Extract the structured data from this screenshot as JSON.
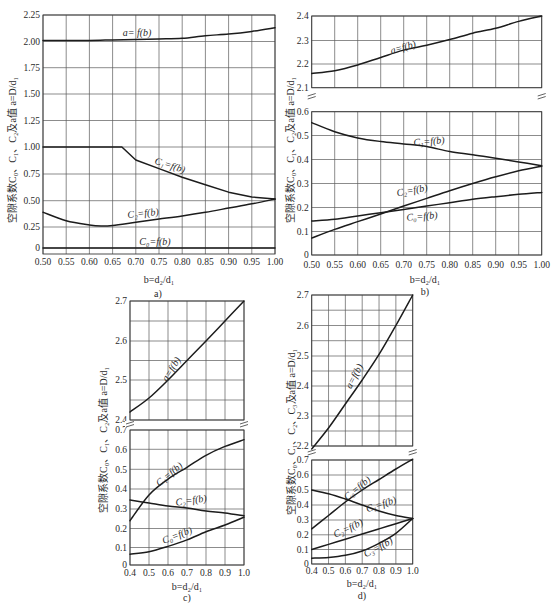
{
  "chart_data": [
    {
      "id": "a",
      "type": "line",
      "caption": "a)",
      "title": "",
      "xlabel": "b=d₂/d₁",
      "ylabel": "空隙系数C₀、C₁、C₂及a值  a=D/d₁",
      "xlim": [
        0.5,
        1.0
      ],
      "x_ticks": [
        0.5,
        0.55,
        0.6,
        0.65,
        0.7,
        0.75,
        0.8,
        0.85,
        0.9,
        0.95,
        1.0
      ],
      "x_tick_labels": [
        "0.50",
        "0.55",
        "0.60",
        "0.65",
        "0.70",
        "0.75",
        "0.80",
        "0.85",
        "0.90",
        "0.95",
        "1.00"
      ],
      "grid": true,
      "y_axes": [
        {
          "range": [
            0,
            2.25
          ],
          "ticks": [
            0,
            0.25,
            0.5,
            0.75,
            1.0,
            1.25,
            1.5,
            1.75,
            2.0,
            2.25
          ],
          "tick_labels": [
            "0",
            "0.25",
            "0.50",
            "0.75",
            "1.00",
            "1.25",
            "1.50",
            "1.75",
            "2.00",
            "2.25"
          ]
        }
      ],
      "series": [
        {
          "name": "a",
          "label": "a= f(b)",
          "axis": 0,
          "x": [
            0.5,
            0.55,
            0.6,
            0.65,
            0.7,
            0.75,
            0.8,
            0.85,
            0.9,
            0.95,
            1.0
          ],
          "y": [
            2.01,
            2.01,
            2.01,
            2.015,
            2.02,
            2.024,
            2.03,
            2.055,
            2.07,
            2.095,
            2.13
          ]
        },
        {
          "name": "C1",
          "label": "C₁=f(b)",
          "axis": 0,
          "x": [
            0.5,
            0.55,
            0.6,
            0.65,
            0.67,
            0.7,
            0.75,
            0.8,
            0.85,
            0.9,
            0.95,
            1.0
          ],
          "y": [
            1.0,
            1.0,
            1.0,
            1.0,
            1.0,
            0.88,
            0.8,
            0.72,
            0.65,
            0.58,
            0.535,
            0.515
          ]
        },
        {
          "name": "C2",
          "label": "C₂=f(b)",
          "axis": 0,
          "x": [
            0.5,
            0.55,
            0.6,
            0.625,
            0.65,
            0.7,
            0.75,
            0.8,
            0.85,
            0.9,
            0.95,
            1.0
          ],
          "y": [
            0.39,
            0.31,
            0.27,
            0.26,
            0.265,
            0.295,
            0.325,
            0.355,
            0.39,
            0.43,
            0.47,
            0.515
          ]
        },
        {
          "name": "C0",
          "label": "C₀=f(b)",
          "axis": 0,
          "x": [
            0.5,
            1.0
          ],
          "y": [
            0,
            0
          ]
        }
      ]
    },
    {
      "id": "b",
      "type": "line",
      "caption": "b)",
      "title": "",
      "xlabel": "b=d₂/d₁",
      "ylabel": "空隙系数C₀、C₁、C₂及a值  a=D/d₁",
      "xlim": [
        0.5,
        1.0
      ],
      "x_ticks": [
        0.5,
        0.55,
        0.6,
        0.65,
        0.7,
        0.75,
        0.8,
        0.85,
        0.9,
        0.95,
        1.0
      ],
      "x_tick_labels": [
        "0.50",
        "0.55",
        "0.60",
        "0.65",
        "0.70",
        "0.75",
        "0.80",
        "0.85",
        "0.90",
        "0.95",
        "1.00"
      ],
      "grid": true,
      "axis_break": true,
      "y_axes": [
        {
          "range": [
            2.1,
            2.4
          ],
          "ticks": [
            2.1,
            2.2,
            2.3,
            2.4
          ],
          "tick_labels": [
            "2.1",
            "2.2",
            "2.3",
            "2.4"
          ]
        },
        {
          "range": [
            0,
            0.6
          ],
          "ticks": [
            0,
            0.1,
            0.2,
            0.3,
            0.4,
            0.5,
            0.6
          ],
          "tick_labels": [
            "0",
            "0.1",
            "0.2",
            "0.3",
            "0.4",
            "0.5",
            "0.6"
          ]
        }
      ],
      "series": [
        {
          "name": "a",
          "label": "a=f(b)",
          "axis": 0,
          "x": [
            0.5,
            0.55,
            0.6,
            0.65,
            0.7,
            0.75,
            0.8,
            0.85,
            0.9,
            0.95,
            1.0
          ],
          "y": [
            2.16,
            2.172,
            2.196,
            2.228,
            2.259,
            2.28,
            2.304,
            2.33,
            2.35,
            2.378,
            2.4
          ]
        },
        {
          "name": "C1",
          "label": "C₁=f(b)",
          "axis": 1,
          "x": [
            0.5,
            0.55,
            0.6,
            0.65,
            0.7,
            0.75,
            0.8,
            0.85,
            0.9,
            0.95,
            1.0
          ],
          "y": [
            0.554,
            0.516,
            0.49,
            0.475,
            0.465,
            0.454,
            0.433,
            0.42,
            0.405,
            0.39,
            0.374
          ]
        },
        {
          "name": "C2",
          "label": "C₂=f(b)",
          "axis": 1,
          "x": [
            0.5,
            0.55,
            0.6,
            0.65,
            0.7,
            0.75,
            0.8,
            0.85,
            0.9,
            0.95,
            1.0
          ],
          "y": [
            0.072,
            0.109,
            0.141,
            0.173,
            0.206,
            0.238,
            0.27,
            0.3,
            0.328,
            0.353,
            0.372
          ]
        },
        {
          "name": "C0",
          "label": "C₀=f(b)",
          "axis": 1,
          "x": [
            0.5,
            0.55,
            0.6,
            0.65,
            0.7,
            0.75,
            0.8,
            0.85,
            0.9,
            0.95,
            1.0
          ],
          "y": [
            0.144,
            0.151,
            0.165,
            0.178,
            0.192,
            0.206,
            0.22,
            0.234,
            0.245,
            0.255,
            0.263
          ]
        }
      ]
    },
    {
      "id": "c",
      "type": "line",
      "caption": "c)",
      "title": "",
      "xlabel": "b=d₂/d₁",
      "ylabel": "空隙系数C₀、C₁、C₂及a值  a=D/d₁",
      "xlim": [
        0.4,
        1.0
      ],
      "x_ticks": [
        0.4,
        0.5,
        0.6,
        0.7,
        0.8,
        0.9,
        1.0
      ],
      "x_tick_labels": [
        "0.4",
        "0.5",
        "0.6",
        "0.7",
        "0.8",
        "0.9",
        "1.0"
      ],
      "grid": true,
      "axis_break": true,
      "y_axes": [
        {
          "range": [
            2.4,
            2.7
          ],
          "ticks": [
            2.4,
            2.5,
            2.6,
            2.7
          ],
          "tick_labels": [
            "2.4",
            "2.5",
            "2.6",
            "2.7"
          ]
        },
        {
          "range": [
            0,
            0.7
          ],
          "ticks": [
            0,
            0.1,
            0.2,
            0.3,
            0.4,
            0.5,
            0.6,
            0.7
          ],
          "tick_labels": [
            "0",
            "0.1",
            "0.2",
            "0.3",
            "0.4",
            "0.5",
            "0.6",
            "0.7"
          ]
        }
      ],
      "series": [
        {
          "name": "a",
          "label": "a=f(b)",
          "axis": 0,
          "x": [
            0.4,
            0.5,
            0.6,
            0.7,
            0.8,
            0.9,
            1.0
          ],
          "y": [
            2.42,
            2.455,
            2.5,
            2.55,
            2.6,
            2.65,
            2.7
          ]
        },
        {
          "name": "C1",
          "label": "C₁=f(b)",
          "axis": 1,
          "x": [
            0.4,
            0.5,
            0.6,
            0.7,
            0.8,
            0.9,
            1.0
          ],
          "y": [
            0.24,
            0.37,
            0.45,
            0.51,
            0.57,
            0.615,
            0.65
          ]
        },
        {
          "name": "C2",
          "label": "C₂=f(b)",
          "axis": 1,
          "x": [
            0.4,
            0.5,
            0.6,
            0.7,
            0.8,
            0.9,
            1.0
          ],
          "y": [
            0.345,
            0.33,
            0.315,
            0.305,
            0.29,
            0.28,
            0.265
          ]
        },
        {
          "name": "C0",
          "label": "C₀=f(b)",
          "axis": 1,
          "x": [
            0.4,
            0.5,
            0.6,
            0.7,
            0.8,
            0.9,
            1.0
          ],
          "y": [
            0.062,
            0.076,
            0.106,
            0.14,
            0.183,
            0.218,
            0.258
          ]
        }
      ]
    },
    {
      "id": "d",
      "type": "line",
      "caption": "d)",
      "title": "",
      "xlabel": "b=d₂/d₁",
      "ylabel": "空隙系数C₀、C₁、C₂、C₃及a值  a=D/d₁",
      "xlim": [
        0.4,
        1.0
      ],
      "x_ticks": [
        0.4,
        0.5,
        0.6,
        0.7,
        0.8,
        0.9,
        1.0
      ],
      "x_tick_labels": [
        "0.4",
        "0.5",
        "0.6",
        "0.7",
        "0.8",
        "0.9",
        "1.0"
      ],
      "grid": true,
      "axis_break": true,
      "y_axes": [
        {
          "range": [
            2.2,
            2.7
          ],
          "ticks": [
            2.2,
            2.3,
            2.4,
            2.5,
            2.6,
            2.7
          ],
          "tick_labels": [
            "2.2",
            "2.3",
            "2.4",
            "2.5",
            "2.6",
            "2.7"
          ]
        },
        {
          "range": [
            0,
            0.7
          ],
          "ticks": [
            0,
            0.1,
            0.2,
            0.3,
            0.4,
            0.5,
            0.6,
            0.7
          ],
          "tick_labels": [
            "0",
            "0.1",
            "0.2",
            "0.3",
            "0.4",
            "0.5",
            "0.6",
            "0.7"
          ]
        }
      ],
      "series": [
        {
          "name": "a",
          "label": "a=f(b)",
          "axis": 0,
          "x": [
            0.4,
            0.5,
            0.6,
            0.7,
            0.8,
            0.9,
            1.0
          ],
          "y": [
            2.19,
            2.26,
            2.34,
            2.42,
            2.505,
            2.6,
            2.7
          ]
        },
        {
          "name": "C0",
          "label": "C₀=f(b)",
          "axis": 1,
          "x": [
            0.4,
            0.5,
            0.6,
            0.7,
            0.8,
            0.9,
            1.0
          ],
          "y": [
            0.24,
            0.33,
            0.42,
            0.5,
            0.57,
            0.64,
            0.705
          ]
        },
        {
          "name": "C1",
          "label": "C₁=f(b)",
          "axis": 1,
          "x": [
            0.4,
            0.5,
            0.6,
            0.7,
            0.8,
            0.9,
            1.0
          ],
          "y": [
            0.5,
            0.475,
            0.44,
            0.4,
            0.36,
            0.33,
            0.31
          ]
        },
        {
          "name": "C2",
          "label": "C₂=f(b)",
          "axis": 1,
          "x": [
            0.4,
            0.5,
            0.6,
            0.7,
            0.8,
            0.9,
            1.0
          ],
          "y": [
            0.1,
            0.135,
            0.17,
            0.205,
            0.24,
            0.275,
            0.31
          ]
        },
        {
          "name": "C3",
          "label": "C₃=f(b)",
          "axis": 1,
          "x": [
            0.4,
            0.5,
            0.6,
            0.7,
            0.8,
            0.9,
            1.0
          ],
          "y": [
            0.04,
            0.045,
            0.06,
            0.09,
            0.142,
            0.21,
            0.31
          ]
        }
      ]
    }
  ]
}
